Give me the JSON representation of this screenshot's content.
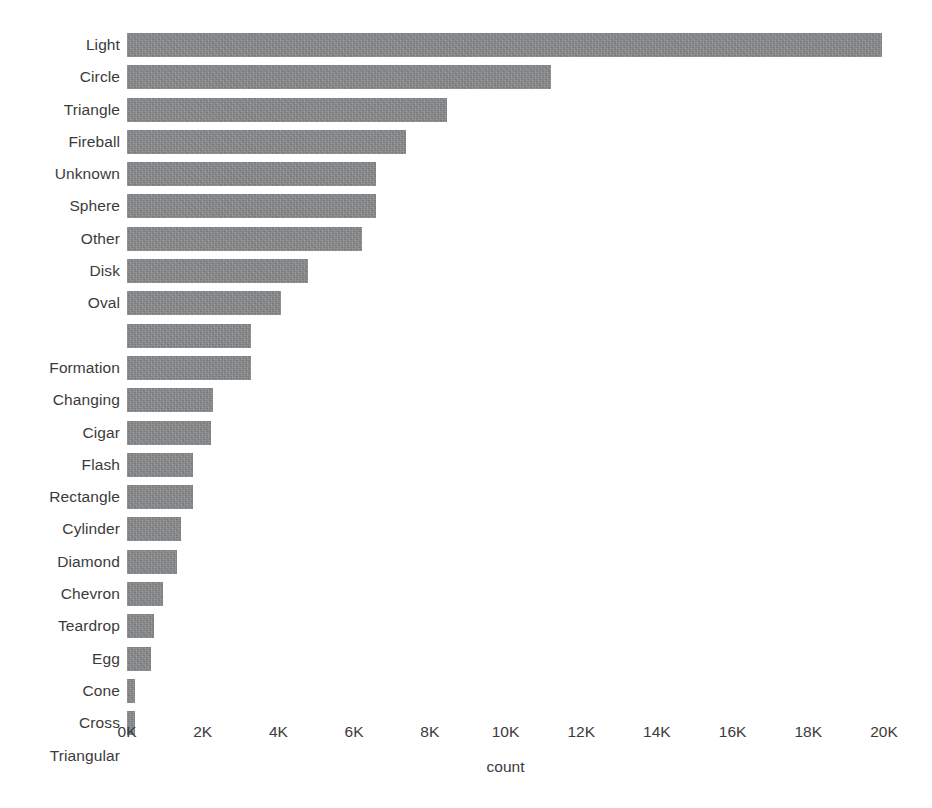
{
  "chart_data": {
    "type": "bar",
    "orientation": "horizontal",
    "title": "",
    "xlabel": "count",
    "ylabel": "",
    "xlim": [
      0,
      20000
    ],
    "grid": false,
    "legend": null,
    "bar_color": "#8a8c8e",
    "background_color": "#ffffff",
    "x_ticks": [
      {
        "value": 0,
        "label": "0K"
      },
      {
        "value": 2000,
        "label": "2K"
      },
      {
        "value": 4000,
        "label": "4K"
      },
      {
        "value": 6000,
        "label": "6K"
      },
      {
        "value": 8000,
        "label": "8K"
      },
      {
        "value": 10000,
        "label": "10K"
      },
      {
        "value": 12000,
        "label": "12K"
      },
      {
        "value": 14000,
        "label": "14K"
      },
      {
        "value": 16000,
        "label": "16K"
      },
      {
        "value": 18000,
        "label": "18K"
      },
      {
        "value": 20000,
        "label": "20K"
      }
    ],
    "categories": [
      "Light",
      "Circle",
      "Triangle",
      "Fireball",
      "Unknown",
      "Sphere",
      "Other",
      "Disk",
      "Oval",
      "",
      "Formation",
      "Changing",
      "Cigar",
      "Flash",
      "Rectangle",
      "Cylinder",
      "Diamond",
      "Chevron",
      "Teardrop",
      "Egg",
      "Cone",
      "Cross",
      "Triangular"
    ],
    "values": [
      19950,
      11200,
      8450,
      7370,
      6580,
      6570,
      6210,
      4780,
      4070,
      3280,
      3270,
      2280,
      2210,
      1745,
      1740,
      1430,
      1320,
      950,
      720,
      630,
      210,
      200,
      0
    ],
    "bars": [
      {
        "category": "Light",
        "value": 19950
      },
      {
        "category": "Circle",
        "value": 11200
      },
      {
        "category": "Triangle",
        "value": 8450
      },
      {
        "category": "Fireball",
        "value": 7370
      },
      {
        "category": "Unknown",
        "value": 6580
      },
      {
        "category": "Sphere",
        "value": 6570
      },
      {
        "category": "Other",
        "value": 6210
      },
      {
        "category": "Disk",
        "value": 4780
      },
      {
        "category": "Oval",
        "value": 4070
      },
      {
        "category": "",
        "value": 3280
      },
      {
        "category": "Formation",
        "value": 3270
      },
      {
        "category": "Changing",
        "value": 2280
      },
      {
        "category": "Cigar",
        "value": 2210
      },
      {
        "category": "Flash",
        "value": 1745
      },
      {
        "category": "Rectangle",
        "value": 1740
      },
      {
        "category": "Cylinder",
        "value": 1430
      },
      {
        "category": "Diamond",
        "value": 1320
      },
      {
        "category": "Chevron",
        "value": 950
      },
      {
        "category": "Teardrop",
        "value": 720
      },
      {
        "category": "Egg",
        "value": 630
      },
      {
        "category": "Cone",
        "value": 210
      },
      {
        "category": "Cross",
        "value": 200
      },
      {
        "category": "Triangular",
        "value": 0
      }
    ]
  }
}
